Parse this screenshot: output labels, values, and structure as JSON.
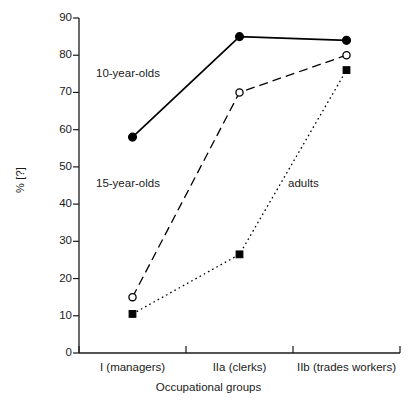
{
  "chart_data": {
    "type": "line",
    "title": "",
    "subtitle": "",
    "xlabel": "Occupational groups",
    "ylabel": "% [?]",
    "categories": [
      "I (managers)",
      "IIa (clerks)",
      "IIb (trades workers)"
    ],
    "ylim": [
      0,
      90
    ],
    "ytick_step": 10,
    "yticks": [
      "90",
      "80",
      "70",
      "60",
      "50",
      "40",
      "30",
      "20",
      "10",
      "0"
    ],
    "ytick_values": [
      90,
      80,
      70,
      60,
      50,
      40,
      30,
      20,
      10,
      0
    ],
    "grid": false,
    "legend_position": "inline-annotations",
    "series": [
      {
        "name": "10-year-olds",
        "values": [
          58,
          85,
          84
        ],
        "marker": "filled-circle",
        "line_style": "solid",
        "color": "#000000"
      },
      {
        "name": "15-year-olds",
        "values": [
          15,
          70,
          80
        ],
        "marker": "open-circle",
        "line_style": "dashed",
        "color": "#000000"
      },
      {
        "name": "adults",
        "values": [
          10.5,
          26.5,
          76
        ],
        "marker": "filled-square",
        "line_style": "dotted",
        "color": "#000000"
      }
    ],
    "annotations": [
      {
        "text": "10-year-olds",
        "series": "10-year-olds"
      },
      {
        "text": "15-year-olds",
        "series": "15-year-olds"
      },
      {
        "text": "adults",
        "series": "adults"
      }
    ]
  },
  "axes": {
    "y_title": "% [?]",
    "x_title": "Occupational groups"
  },
  "colors": {
    "axis": "#1a1a1a",
    "series_ink": "#000000",
    "background": "#ffffff"
  }
}
